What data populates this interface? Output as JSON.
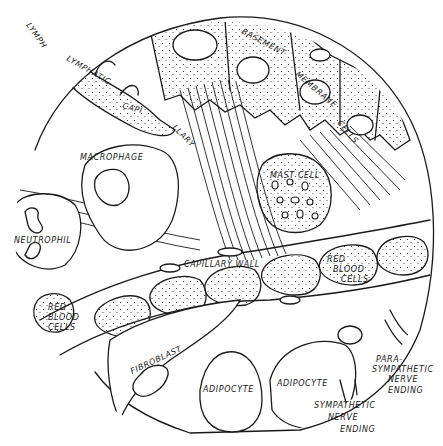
{
  "figure": {
    "style": "black ink line drawing on white",
    "colors": {
      "ink": "#1a1a1a",
      "background": "#ffffff"
    }
  },
  "labels": {
    "lymphatic_capillary_1": "LYMPH",
    "lymphatic_capillary_2": "LYMPHATIC",
    "lymphatic_capillary_3": "CAPI",
    "lymphatic_capillary_4": "LLARY",
    "basement_membrane_1": "BASEMENT",
    "basement_membrane_2": "MEMBRANE",
    "basement_membrane_3": "CELLS",
    "macrophage": "MACROPHAGE",
    "mast_cell": "MAST CELL",
    "neutrophil": "NEUTROPHIL",
    "capillary_wall": "CAPILLARY WALL",
    "red_blood_cells_right_1": "RED",
    "red_blood_cells_right_2": "BLOOD",
    "red_blood_cells_right_3": "CELLS",
    "red_blood_cells_left_1": "RED",
    "red_blood_cells_left_2": "BLOOD",
    "red_blood_cells_left_3": "CELLS",
    "fibroblast": "FIBROBLAST",
    "adipocyte_1": "ADIPOCYTE",
    "adipocyte_2": "ADIPOCYTE",
    "parasympathetic_1": "PARA-",
    "parasympathetic_2": "SYMPATHETIC",
    "parasympathetic_3": "NERVE",
    "parasympathetic_4": "ENDING",
    "sympathetic_1": "SYMPATHETIC",
    "sympathetic_2": "NERVE",
    "sympathetic_3": "ENDING"
  }
}
